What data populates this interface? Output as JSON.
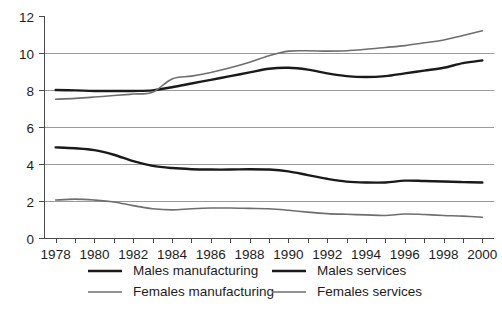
{
  "chart_data": {
    "type": "line",
    "title": "",
    "subtitle": "",
    "xlabel": "",
    "ylabel": "",
    "xlim": [
      1977.4,
      2000.6
    ],
    "ylim": [
      0,
      12
    ],
    "yticks": [
      0,
      2,
      4,
      6,
      8,
      10,
      12
    ],
    "ytick_labels": [
      "0",
      "2",
      "4",
      "6",
      "8",
      "10",
      "12"
    ],
    "xticks": [
      1978,
      1979,
      1980,
      1981,
      1982,
      1983,
      1984,
      1985,
      1986,
      1987,
      1988,
      1989,
      1990,
      1991,
      1992,
      1993,
      1994,
      1995,
      1996,
      1997,
      1998,
      1999,
      2000
    ],
    "xtick_labels_shown": [
      "1978",
      "1980",
      "1982",
      "1984",
      "1986",
      "1988",
      "1990",
      "1992",
      "1994",
      "1996",
      "1998",
      "2000"
    ],
    "grid": "horizontal",
    "gridlines_at": [
      2,
      4,
      6,
      8,
      10
    ],
    "legend_position": "bottom",
    "legend_columns": 2,
    "x": [
      1978,
      1979,
      1980,
      1981,
      1982,
      1983,
      1984,
      1985,
      1986,
      1987,
      1988,
      1989,
      1990,
      1991,
      1992,
      1993,
      1994,
      1995,
      1996,
      1997,
      1998,
      1999,
      2000
    ],
    "series": [
      {
        "name": "Males manufacturing",
        "color": "#1a1a1a",
        "width": 2.4,
        "values": [
          4.9,
          4.85,
          4.75,
          4.5,
          4.15,
          3.9,
          3.78,
          3.72,
          3.7,
          3.7,
          3.72,
          3.7,
          3.6,
          3.4,
          3.2,
          3.05,
          3.0,
          3.0,
          3.1,
          3.08,
          3.05,
          3.02,
          3.0
        ]
      },
      {
        "name": "Males services",
        "color": "#1a1a1a",
        "width": 2.4,
        "values": [
          8.0,
          7.98,
          7.95,
          7.95,
          7.95,
          7.98,
          8.15,
          8.35,
          8.55,
          8.75,
          8.95,
          9.15,
          9.2,
          9.1,
          8.9,
          8.75,
          8.7,
          8.75,
          8.9,
          9.05,
          9.2,
          9.45,
          9.6
        ]
      },
      {
        "name": "Females manufacturing",
        "color": "#6e6e6e",
        "width": 1.6,
        "values": [
          2.05,
          2.1,
          2.05,
          1.95,
          1.75,
          1.58,
          1.52,
          1.58,
          1.62,
          1.62,
          1.6,
          1.58,
          1.5,
          1.4,
          1.32,
          1.28,
          1.25,
          1.22,
          1.3,
          1.27,
          1.22,
          1.18,
          1.12
        ]
      },
      {
        "name": "Females services",
        "color": "#6e6e6e",
        "width": 1.6,
        "values": [
          7.5,
          7.55,
          7.62,
          7.7,
          7.78,
          7.88,
          8.6,
          8.75,
          8.95,
          9.2,
          9.5,
          9.85,
          10.1,
          10.12,
          10.1,
          10.12,
          10.2,
          10.3,
          10.4,
          10.55,
          10.7,
          10.95,
          11.2
        ]
      }
    ]
  },
  "legend": {
    "items": [
      {
        "label": "Males manufacturing",
        "color": "#1a1a1a",
        "width": 2.6
      },
      {
        "label": "Males services",
        "color": "#1a1a1a",
        "width": 2.6
      },
      {
        "label": "Females manufacturing",
        "color": "#6e6e6e",
        "width": 1.7
      },
      {
        "label": "Females services",
        "color": "#6e6e6e",
        "width": 1.7
      }
    ]
  }
}
